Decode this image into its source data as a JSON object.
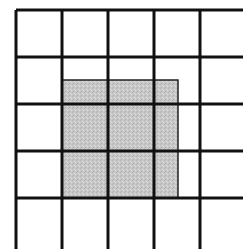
{
  "diagram": {
    "type": "grid-with-shaded-region",
    "background": "#ffffff",
    "line_color": "#111111",
    "line_width": 3,
    "shade_color": "#c8c8c8",
    "shade_border_color": "#222222",
    "grid": {
      "origin": [
        16,
        10
      ],
      "cell_size": [
        46,
        47
      ],
      "columns_visible": 5,
      "rows_visible": 5,
      "vertical_lines_x": [
        16,
        62,
        108,
        154,
        200
      ],
      "horizontal_lines_y": [
        10,
        57,
        104,
        151,
        198
      ],
      "extends_right": true,
      "extends_bottom": true
    },
    "shaded_region": {
      "x": 62,
      "y": 80,
      "width": 116,
      "height": 118,
      "description": "2.5 columns wide by 2.5 rows tall, aligned to bottom-left grid corner"
    }
  }
}
